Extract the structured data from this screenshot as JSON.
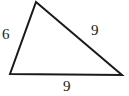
{
  "figure": {
    "type": "triangle-diagram",
    "background_color": "#ffffff",
    "stroke_color": "#1a1a1a",
    "stroke_width": 2,
    "label_color": "#1a1a1a",
    "vertices": {
      "apex": {
        "x": 36,
        "y": 2
      },
      "bottom_left": {
        "x": 10,
        "y": 74
      },
      "bottom_right": {
        "x": 122,
        "y": 75
      }
    },
    "sides": [
      {
        "name": "left-side",
        "label": "6",
        "from": "bottom_left",
        "to": "apex"
      },
      {
        "name": "right-side",
        "label": "9",
        "from": "apex",
        "to": "bottom_right"
      },
      {
        "name": "bottom-side",
        "label": "9",
        "from": "bottom_left",
        "to": "bottom_right"
      }
    ],
    "labels": {
      "left": "6",
      "right": "9",
      "bottom": "9"
    }
  }
}
